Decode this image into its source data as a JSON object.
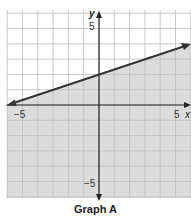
{
  "caption": "Graph A",
  "chart_data": {
    "type": "line",
    "title": "Graph A",
    "xlabel": "x",
    "ylabel": "y",
    "xlim": [
      -6,
      6
    ],
    "ylim": [
      -6,
      6
    ],
    "grid": true,
    "tick_labels": {
      "x": [
        "-5",
        "5"
      ],
      "y": [
        "5",
        "-5"
      ]
    },
    "series": [
      {
        "name": "boundary line",
        "style": "solid",
        "equation": "y = (1/3)x + 2",
        "x": [
          -6,
          0,
          6
        ],
        "y": [
          0,
          2,
          4
        ]
      }
    ],
    "shaded_region": "below line (y < (1/3)x + 2)",
    "colors": {
      "shade": "#d9d9d9",
      "grid": "#bdbdbd",
      "line": "#333333"
    }
  }
}
